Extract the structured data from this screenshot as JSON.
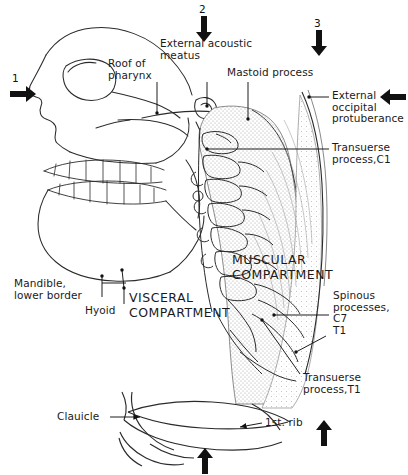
{
  "figure": {
    "type": "anatomical-line-drawing"
  },
  "markers": [
    {
      "id": "1",
      "label": "1",
      "direction": "right",
      "x": 12,
      "y": 78
    },
    {
      "id": "2",
      "label": "2",
      "direction": "down",
      "x": 198,
      "y": 8
    },
    {
      "id": "3",
      "label": "3",
      "direction": "down",
      "x": 313,
      "y": 22
    },
    {
      "id": "4",
      "label": "",
      "direction": "left",
      "x": 382,
      "y": 88
    },
    {
      "id": "5",
      "label": "",
      "direction": "up",
      "x": 199,
      "y": 448
    },
    {
      "id": "6",
      "label": "",
      "direction": "up",
      "x": 318,
      "y": 420
    }
  ],
  "labels": {
    "roof_of_pharynx": "Roof of\npharynx",
    "external_acoustic_meatus": "External acoustic\nmeatus",
    "mastoid_process": "Mastoid process",
    "external_occipital_protuberance": "External\noccipital\nprotuberance",
    "transverse_process_c1": "Transuerse\nprocess,C1",
    "muscular_compartment": "MUSCULAR\nCOMPARTMENT",
    "visceral_compartment": "VISCERAL\nCOMPARTMENT",
    "mandible_lower_border": "Mandible,\nlower border",
    "hyoid": "Hyoid",
    "spinous_processes": "Spinous\nprocesses,\nC7\nT1",
    "transverse_process_t1": "Transuerse\nprocess,T1",
    "clavicle": "Clauicle",
    "first_rib": "1st. rib"
  },
  "colors": {
    "ink": "#1a1a1a",
    "line": "#2b2b2b",
    "stipple": "#9a9a9a",
    "paper": "#ffffff"
  }
}
